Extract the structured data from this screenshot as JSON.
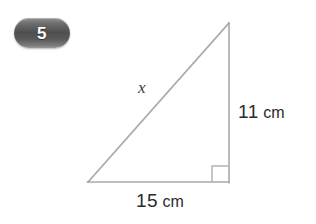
{
  "page": {
    "background_color": "#ffffff",
    "width": 316,
    "height": 224
  },
  "badge": {
    "number": "5",
    "shape": "pill",
    "fill_color": "#5a5a5a",
    "text_color": "#ffffff"
  },
  "figure": {
    "type": "right-triangle",
    "stroke_color": "#a9a9a9",
    "stroke_width": 1.5,
    "vertices": {
      "apex": [
        229,
        23
      ],
      "bottom_left": [
        88,
        182
      ],
      "bottom_right": [
        229,
        182
      ]
    },
    "right_angle_marker": {
      "at_vertex": "bottom_right",
      "size": 16
    },
    "labels": {
      "hypotenuse": "x",
      "vertical_value": "11",
      "vertical_unit": "cm",
      "base_value": "15",
      "base_unit": "cm"
    }
  },
  "problem": {
    "number": "5",
    "unknown_side": "x",
    "known_sides": [
      {
        "side": "vertical",
        "length": 11,
        "unit": "cm"
      },
      {
        "side": "base",
        "length": 15,
        "unit": "cm"
      }
    ]
  }
}
